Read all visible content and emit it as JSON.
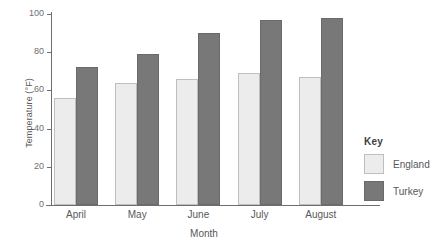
{
  "chart_data": {
    "type": "bar",
    "title": "",
    "subtitle": "",
    "xlabel": "Month",
    "ylabel": "Temperature (°F)",
    "categories": [
      "April",
      "May",
      "June",
      "July",
      "August"
    ],
    "series": [
      {
        "name": "England",
        "values": [
          56,
          64,
          66,
          69,
          67
        ],
        "color": "#ececec"
      },
      {
        "name": "Turkey",
        "values": [
          72,
          79,
          90,
          97,
          98
        ],
        "color": "#787878"
      }
    ],
    "ylim": [
      0,
      100
    ],
    "yticks": [
      0,
      20,
      40,
      60,
      80,
      100
    ],
    "ytick_labels": [
      "0",
      "20",
      "40",
      "60",
      "80",
      "100"
    ],
    "grid": false,
    "legend_position": "right",
    "legend_title": "Key"
  },
  "axes": {
    "y_title": "Temperature (°F)",
    "x_title": "Month"
  },
  "legend": {
    "title": "Key",
    "entries": [
      {
        "label": "England"
      },
      {
        "label": "Turkey"
      }
    ]
  }
}
